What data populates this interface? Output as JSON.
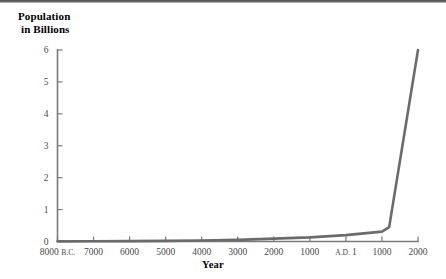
{
  "chart_data": {
    "type": "line",
    "title": "",
    "ylabel": "Population in Billions",
    "ylabel_line1": "Population",
    "ylabel_line2": "in Billions",
    "xlabel": "Year",
    "x_tick_labels": [
      "8000 B.C.",
      "7000",
      "6000",
      "5000",
      "4000",
      "3000",
      "2000",
      "1000",
      "A.D. 1",
      "1000",
      "2000"
    ],
    "x_tick_values": [
      -8000,
      -7000,
      -6000,
      -5000,
      -4000,
      -3000,
      -2000,
      -1000,
      1,
      1000,
      2000
    ],
    "y_tick_labels": [
      "0",
      "1",
      "2",
      "3",
      "4",
      "5",
      "6"
    ],
    "y_tick_values": [
      0,
      1,
      2,
      3,
      4,
      5,
      6
    ],
    "ylim": [
      0,
      6
    ],
    "xlim": [
      -8000,
      2000
    ],
    "grid": false,
    "legend": "none",
    "line_color": "#6b6b6b",
    "axis_color": "#7a7a7a",
    "series": [
      {
        "name": "World Population",
        "x": [
          -8000,
          -7000,
          -6000,
          -5000,
          -4000,
          -3000,
          -2000,
          -1000,
          1,
          1000,
          1200,
          2000
        ],
        "values": [
          0.005,
          0.008,
          0.012,
          0.02,
          0.03,
          0.05,
          0.09,
          0.13,
          0.2,
          0.31,
          0.45,
          6.0
        ]
      }
    ]
  }
}
